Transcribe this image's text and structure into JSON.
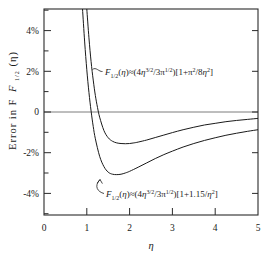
{
  "chart_data": {
    "type": "line",
    "title": "",
    "xlabel": "η",
    "ylabel": "Error in F",
    "ylabel_sub": "1/2",
    "ylabel_arg": "(η)",
    "xlim": [
      0,
      5
    ],
    "ylim": [
      -5,
      5
    ],
    "grid": false,
    "legend": "inline-annotations",
    "xticks": [
      "0",
      "1",
      "2",
      "3",
      "4",
      "5"
    ],
    "xtick_values": [
      0,
      1,
      2,
      3,
      4,
      5
    ],
    "yticks": [
      "4%",
      "2%",
      "0",
      "-2%",
      "-4%"
    ],
    "ytick_values": [
      4,
      2,
      0,
      -2,
      -4
    ],
    "yminor_values": [
      3,
      1,
      -1,
      -3
    ],
    "xminor_values": [
      0.5,
      1.5,
      2.5,
      3.5,
      4.5
    ],
    "series": [
      {
        "name": "sommerfeld-expansion",
        "label_parts": {
          "f": "F",
          "sub": "1/2",
          "arg": "(η)",
          "approx": "≈",
          "body": "(4η",
          "exp1": "3/2",
          "mid": "/3π",
          "exp2": "1/2",
          "close": ")[1+π",
          "exp3": "2",
          "tail": "/8η",
          "exp4": "2",
          "end": "]"
        },
        "label_plain": "F(1/2)(η) ≈ (4η^(3/2)/3π^(1/2))[1+π²/8η²]",
        "x": [
          1.0,
          1.05,
          1.1,
          1.15,
          1.2,
          1.25,
          1.3,
          1.4,
          1.5,
          1.6,
          1.7,
          1.8,
          1.9,
          2.0,
          2.1,
          2.2,
          2.4,
          2.6,
          2.8,
          3.0,
          3.25,
          3.5,
          3.75,
          4.0,
          4.25,
          4.5,
          4.75,
          5.0
        ],
        "y": [
          5.0,
          3.6,
          2.45,
          1.55,
          0.8,
          0.22,
          -0.25,
          -0.9,
          -1.25,
          -1.42,
          -1.5,
          -1.53,
          -1.54,
          -1.53,
          -1.5,
          -1.46,
          -1.36,
          -1.24,
          -1.12,
          -1.0,
          -0.86,
          -0.74,
          -0.63,
          -0.55,
          -0.47,
          -0.41,
          -0.36,
          -0.31
        ]
      },
      {
        "name": "one-point-one-five-fit",
        "label_parts": {
          "f": "F",
          "sub": "1/2",
          "arg": "(η)",
          "approx": "≈",
          "body": "(4η",
          "exp1": "3/2",
          "mid": "/3π",
          "exp2": "1/2",
          "close": ")[1+1.15/η",
          "exp3": "2",
          "end": "]"
        },
        "label_plain": "F(1/2)(η) ≈ (4η^(3/2)/3π^(1/2))[1+1.15/η²]",
        "x": [
          0.9,
          0.95,
          1.0,
          1.05,
          1.1,
          1.15,
          1.2,
          1.3,
          1.4,
          1.5,
          1.6,
          1.7,
          1.8,
          1.9,
          2.0,
          2.2,
          2.4,
          2.6,
          2.8,
          3.0,
          3.25,
          3.5,
          3.75,
          4.0,
          4.25,
          4.5,
          4.75,
          5.0
        ],
        "y": [
          5.0,
          3.4,
          2.05,
          0.95,
          0.05,
          -0.7,
          -1.3,
          -2.15,
          -2.65,
          -2.92,
          -3.02,
          -3.04,
          -3.02,
          -2.96,
          -2.88,
          -2.68,
          -2.47,
          -2.26,
          -2.07,
          -1.9,
          -1.7,
          -1.53,
          -1.38,
          -1.25,
          -1.13,
          -1.03,
          -0.94,
          -0.86
        ]
      }
    ],
    "annotations": [
      {
        "name": "upper-curve-annotation",
        "anchor_x": 1.18,
        "anchor_y": 2.0,
        "text_x": 1.45,
        "text_y": 1.75
      },
      {
        "name": "lower-curve-annotation",
        "anchor_x": 1.52,
        "anchor_y": -2.72,
        "text_x": 1.48,
        "text_y": -3.95
      }
    ],
    "colors": {
      "curve": "#1a1a1a",
      "frame": "#2a2a2a",
      "zeroline": "#7d7d7d",
      "background": "#ffffff"
    }
  }
}
